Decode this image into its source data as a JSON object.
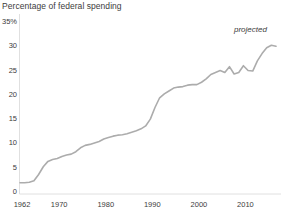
{
  "chart_data": {
    "type": "line",
    "title": "Percentage of federal spending",
    "xlabel": "",
    "ylabel": "",
    "xlim": [
      1962,
      1967
    ],
    "ylim": [
      0,
      35
    ],
    "grid": false,
    "legend": null,
    "y_ticks": [
      {
        "value": 35,
        "label": "35%"
      },
      {
        "value": 30,
        "label": "30"
      },
      {
        "value": 25,
        "label": "25"
      },
      {
        "value": 20,
        "label": "20"
      },
      {
        "value": 15,
        "label": "15"
      },
      {
        "value": 10,
        "label": "10"
      },
      {
        "value": 5,
        "label": "5"
      },
      {
        "value": 0,
        "label": "0"
      }
    ],
    "x_ticks": [
      {
        "value": 1962,
        "label": "1962"
      },
      {
        "value": 1970,
        "label": "1970"
      },
      {
        "value": 1980,
        "label": "1980"
      },
      {
        "value": 1990,
        "label": "1990"
      },
      {
        "value": 2000,
        "label": "2000"
      },
      {
        "value": 2010,
        "label": "2010"
      }
    ],
    "x_range": [
      1962,
      2017
    ],
    "annotations": [
      {
        "text": "projected",
        "x": 2011.5,
        "y": 33.6,
        "style": "italic"
      }
    ],
    "line_color": "#acacac",
    "line_width": 1.6,
    "series": [
      {
        "name": "Percentage of federal spending",
        "x": [
          1962,
          1963,
          1964,
          1965,
          1966,
          1967,
          1968,
          1969,
          1970,
          1971,
          1972,
          1973,
          1974,
          1975,
          1976,
          1977,
          1978,
          1979,
          1980,
          1981,
          1982,
          1983,
          1984,
          1985,
          1986,
          1987,
          1988,
          1989,
          1990,
          1991,
          1992,
          1993,
          1994,
          1995,
          1996,
          1997,
          1998,
          1999,
          2000,
          2001,
          2002,
          2003,
          2004,
          2005,
          2006,
          2007,
          2008,
          2009,
          2010,
          2011,
          2012,
          2013,
          2014,
          2015,
          2016,
          2017
        ],
        "values": [
          1.9,
          1.9,
          2.0,
          2.3,
          3.6,
          5.2,
          6.3,
          6.7,
          6.9,
          7.3,
          7.6,
          7.8,
          8.3,
          9.1,
          9.6,
          9.8,
          10.1,
          10.4,
          10.9,
          11.2,
          11.5,
          11.7,
          11.8,
          12.0,
          12.3,
          12.6,
          13.0,
          13.6,
          15.0,
          17.4,
          19.4,
          20.2,
          20.8,
          21.4,
          21.6,
          21.7,
          22.0,
          22.1,
          22.1,
          22.6,
          23.3,
          24.2,
          24.6,
          25.0,
          24.6,
          25.8,
          24.3,
          24.6,
          26.0,
          25.0,
          24.9,
          27.0,
          28.5,
          29.7,
          30.2,
          30.0
        ]
      }
    ]
  },
  "title": {
    "text": "Percentage of federal spending"
  },
  "axis": {
    "y_axis_name": "percentage-axis",
    "x_axis_name": "year-axis"
  },
  "annotation": {
    "projected_label": "projected"
  },
  "colors": {
    "line": "#acacac",
    "axis": "#d8d8d8",
    "text": "#3c3c3c",
    "background": "#ffffff"
  }
}
